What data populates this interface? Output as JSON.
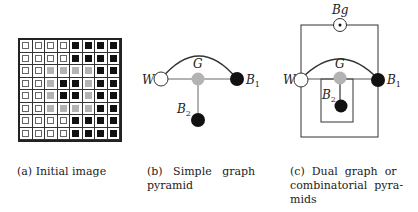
{
  "figure": {
    "panels": [
      {
        "id": "a",
        "caption": "(a) Initial image",
        "grid": {
          "rows": 8,
          "cols": 8,
          "legend": {
            "W": "white",
            "G": "gray",
            "B": "black"
          },
          "cells": [
            [
              "W",
              "W",
              "W",
              "W",
              "B",
              "B",
              "B",
              "B"
            ],
            [
              "W",
              "W",
              "W",
              "W",
              "B",
              "B",
              "B",
              "B"
            ],
            [
              "W",
              "W",
              "G",
              "G",
              "G",
              "G",
              "B",
              "B"
            ],
            [
              "W",
              "W",
              "G",
              "B",
              "B",
              "G",
              "B",
              "B"
            ],
            [
              "W",
              "W",
              "G",
              "B",
              "B",
              "G",
              "B",
              "B"
            ],
            [
              "W",
              "W",
              "G",
              "G",
              "G",
              "G",
              "B",
              "B"
            ],
            [
              "W",
              "W",
              "W",
              "W",
              "B",
              "B",
              "B",
              "B"
            ],
            [
              "W",
              "W",
              "W",
              "W",
              "B",
              "B",
              "B",
              "B"
            ]
          ]
        }
      },
      {
        "id": "b",
        "caption_line1": "(b)   Simple   graph",
        "caption_line2": "pyramid",
        "nodes": {
          "W": "W",
          "G": "G",
          "B1": "B",
          "B1_sub": "1",
          "B2": "B",
          "B2_sub": "2"
        }
      },
      {
        "id": "c",
        "caption_line1": "(c)  Dual  graph  or",
        "caption_line2": "combinatorial  pyra-",
        "caption_line3": "mids",
        "nodes": {
          "Bg": "Bg",
          "W": "W",
          "G": "G",
          "B1": "B",
          "B1_sub": "1",
          "B2": "B",
          "B2_sub": "2"
        }
      }
    ],
    "colors": {
      "white_node": "#ffffff",
      "gray_node": "#b3b3b3",
      "black_node": "#111111",
      "edge_gray": "#9a9a9a",
      "line": "#333333"
    }
  }
}
